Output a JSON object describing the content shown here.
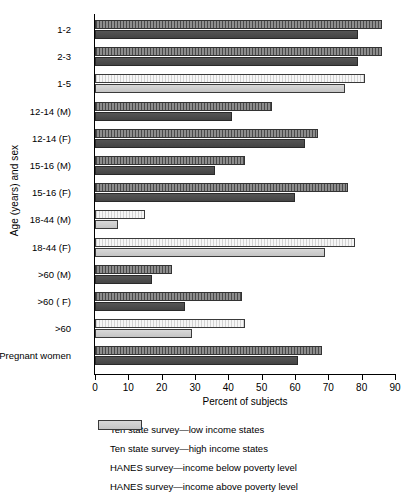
{
  "chart_data": {
    "type": "bar",
    "orientation": "horizontal",
    "title": "",
    "xlabel": "Percent of subjects",
    "ylabel": "Age (years) and sex",
    "xlim": [
      0,
      90
    ],
    "xticks": [
      0,
      10,
      20,
      30,
      40,
      50,
      60,
      70,
      80,
      90
    ],
    "grid": false,
    "legend_position": "bottom",
    "categories": [
      "1-2",
      "2-3",
      "1-5",
      "12-14 (M)",
      "12-14 (F)",
      "15-16 (M)",
      "15-16 (F)",
      "18-44 (M)",
      "18-44 (F)",
      ">60 (M)",
      ">60 ( F)",
      ">60",
      "Pregnant women"
    ],
    "series": [
      {
        "name": "Ten state survey—low income states",
        "key": "s0",
        "values": [
          86,
          86,
          null,
          53,
          67,
          45,
          76,
          null,
          null,
          23,
          44,
          null,
          68
        ]
      },
      {
        "name": "Ten state survey—high income states",
        "key": "s1",
        "values": [
          79,
          79,
          null,
          41,
          63,
          36,
          60,
          null,
          null,
          17,
          27,
          null,
          61
        ]
      },
      {
        "name": "HANES survey—income below poverty level",
        "key": "s2",
        "values": [
          null,
          null,
          81,
          null,
          null,
          null,
          null,
          15,
          78,
          null,
          null,
          45,
          null
        ]
      },
      {
        "name": "HANES survey—income above poverty level",
        "key": "s3",
        "values": [
          null,
          null,
          75,
          null,
          null,
          null,
          null,
          7,
          69,
          null,
          null,
          29,
          null
        ]
      }
    ],
    "group_bars": [
      {
        "category": "1-2",
        "bars": [
          {
            "series": "s0",
            "value": 86
          },
          {
            "series": "s1",
            "value": 79
          }
        ]
      },
      {
        "category": "2-3",
        "bars": [
          {
            "series": "s0",
            "value": 86
          },
          {
            "series": "s1",
            "value": 79
          }
        ]
      },
      {
        "category": "1-5",
        "bars": [
          {
            "series": "s2",
            "value": 81
          },
          {
            "series": "s3",
            "value": 75
          }
        ]
      },
      {
        "category": "12-14 (M)",
        "bars": [
          {
            "series": "s0",
            "value": 53
          },
          {
            "series": "s1",
            "value": 41
          }
        ]
      },
      {
        "category": "12-14 (F)",
        "bars": [
          {
            "series": "s0",
            "value": 67
          },
          {
            "series": "s1",
            "value": 63
          }
        ]
      },
      {
        "category": "15-16 (M)",
        "bars": [
          {
            "series": "s0",
            "value": 45
          },
          {
            "series": "s1",
            "value": 36
          }
        ]
      },
      {
        "category": "15-16 (F)",
        "bars": [
          {
            "series": "s0",
            "value": 76
          },
          {
            "series": "s1",
            "value": 60
          }
        ]
      },
      {
        "category": "18-44 (M)",
        "bars": [
          {
            "series": "s2",
            "value": 15
          },
          {
            "series": "s3",
            "value": 7
          }
        ]
      },
      {
        "category": "18-44 (F)",
        "bars": [
          {
            "series": "s2",
            "value": 78
          },
          {
            "series": "s3",
            "value": 69
          }
        ]
      },
      {
        "category": ">60 (M)",
        "bars": [
          {
            "series": "s0",
            "value": 23
          },
          {
            "series": "s1",
            "value": 17
          }
        ]
      },
      {
        "category": ">60 ( F)",
        "bars": [
          {
            "series": "s0",
            "value": 44
          },
          {
            "series": "s1",
            "value": 27
          }
        ]
      },
      {
        "category": ">60",
        "bars": [
          {
            "series": "s2",
            "value": 45
          },
          {
            "series": "s3",
            "value": 29
          }
        ]
      },
      {
        "category": "Pregnant women",
        "bars": [
          {
            "series": "s0",
            "value": 68
          },
          {
            "series": "s1",
            "value": 61
          }
        ]
      }
    ],
    "colors": {
      "s0": "#6b6b6b",
      "s1": "#4b4b4b",
      "s2": "#ececec",
      "s3": "#cdcdcd",
      "axis": "#000000",
      "background": "#ffffff"
    }
  },
  "legend": {
    "items": [
      {
        "key": "s0",
        "label": "Ten state survey—low income states"
      },
      {
        "key": "s1",
        "label": "Ten state survey—high income states"
      },
      {
        "key": "s2",
        "label": "HANES survey—income below poverty level"
      },
      {
        "key": "s3",
        "label": "HANES survey—income above poverty level"
      }
    ]
  }
}
